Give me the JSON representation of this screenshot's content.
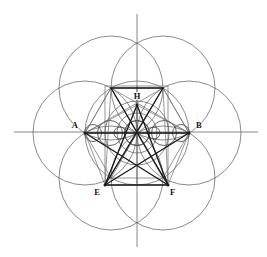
{
  "figure": {
    "canvas": {
      "width": 267,
      "height": 257,
      "background": "#ffffff"
    },
    "center": {
      "x": 137,
      "y": 133
    },
    "radius": 52,
    "colors": {
      "thin_line": "#595959",
      "mid_line": "#4a4a4a",
      "heavy_line": "#1a1a1a",
      "axis": "#6b6b6b",
      "label": "#111111",
      "background": "#ffffff"
    },
    "labels": [
      {
        "id": "A",
        "text": "A",
        "x": 78,
        "y": 128,
        "anchor": "end",
        "point_x": 85,
        "point_y": 133
      },
      {
        "id": "B",
        "text": "B",
        "x": 196,
        "y": 128,
        "anchor": "start",
        "point_x": 189,
        "point_y": 133
      },
      {
        "id": "H",
        "text": "H",
        "x": 137,
        "y": 99,
        "anchor": "middle",
        "point_x": 137,
        "point_y": 105
      },
      {
        "id": "E",
        "text": "E",
        "x": 100,
        "y": 195,
        "anchor": "end",
        "point_x": 105,
        "point_y": 185
      },
      {
        "id": "F",
        "text": "F",
        "x": 170,
        "y": 195,
        "anchor": "start",
        "point_x": 168,
        "point_y": 185
      }
    ],
    "axes": {
      "horizontal": {
        "x1": 14,
        "y1": 132,
        "x2": 258,
        "y2": 132
      },
      "vertical": {
        "x1": 137,
        "y1": 14,
        "x2": 137,
        "y2": 247
      }
    },
    "big_circles": [
      {
        "name": "center-circle",
        "cx": 137,
        "cy": 133,
        "r": 52
      },
      {
        "name": "east-circle",
        "cx": 189,
        "cy": 133,
        "r": 52
      },
      {
        "name": "west-circle",
        "cx": 85,
        "cy": 133,
        "r": 52
      },
      {
        "name": "northeast-circle",
        "cx": 163,
        "cy": 88,
        "r": 52
      },
      {
        "name": "northwest-circle",
        "cx": 111,
        "cy": 88,
        "r": 52
      },
      {
        "name": "southeast-circle",
        "cx": 163,
        "cy": 178,
        "r": 52
      },
      {
        "name": "southwest-circle",
        "cx": 111,
        "cy": 178,
        "r": 52
      }
    ],
    "inner_circles": [
      {
        "name": "inner-circumcircle",
        "cx": 137,
        "cy": 133,
        "r": 32
      },
      {
        "name": "inner-midcircle",
        "cx": 137,
        "cy": 133,
        "r": 20
      },
      {
        "name": "inner-incircle",
        "cx": 137,
        "cy": 133,
        "r": 12.5
      }
    ],
    "axis_small_circles": [
      {
        "name": "axis-circle-1",
        "cx": 93,
        "cy": 133,
        "r": 8.5
      },
      {
        "name": "axis-circle-2",
        "cx": 110,
        "cy": 133,
        "r": 12.5
      },
      {
        "name": "axis-circle-3",
        "cx": 137,
        "cy": 133,
        "r": 12.5
      },
      {
        "name": "axis-circle-4",
        "cx": 164,
        "cy": 133,
        "r": 12.5
      },
      {
        "name": "axis-circle-5",
        "cx": 181,
        "cy": 133,
        "r": 8.5
      },
      {
        "name": "axis-circle-6",
        "cx": 120,
        "cy": 133,
        "r": 6.0
      },
      {
        "name": "axis-circle-7",
        "cx": 154,
        "cy": 133,
        "r": 6.0
      }
    ],
    "hexagon": {
      "name": "inscribed-hexagon",
      "points": "189,133 163,88 111,88 85,133 111,178 163,178"
    },
    "bounding_rectangle": {
      "name": "bounding-rectangle",
      "x": 105,
      "y": 86,
      "width": 63,
      "height": 99
    },
    "star_polygon": {
      "name": "star-pentagram",
      "vertices": [
        {
          "id": "H",
          "x": 137,
          "y": 105
        },
        {
          "id": "NE",
          "x": 163,
          "y": 88
        },
        {
          "id": "B",
          "x": 189,
          "y": 133
        },
        {
          "id": "F",
          "x": 168,
          "y": 185
        },
        {
          "id": "E",
          "x": 105,
          "y": 185
        },
        {
          "id": "A",
          "x": 85,
          "y": 133
        },
        {
          "id": "NW",
          "x": 111,
          "y": 88
        }
      ],
      "heavy_edges": [
        {
          "from": "H",
          "to": "E"
        },
        {
          "from": "H",
          "to": "F"
        },
        {
          "from": "E",
          "to": "F"
        },
        {
          "from": "E",
          "to": "B"
        },
        {
          "from": "F",
          "to": "A"
        },
        {
          "from": "A",
          "to": "B"
        },
        {
          "from": "NW",
          "to": "F"
        },
        {
          "from": "NE",
          "to": "E"
        },
        {
          "from": "NW",
          "to": "NE"
        }
      ],
      "light_edges": [
        {
          "from": "A",
          "to": "H"
        },
        {
          "from": "B",
          "to": "H"
        },
        {
          "from": "A",
          "to": "NE"
        },
        {
          "from": "B",
          "to": "NW"
        },
        {
          "from": "NW",
          "to": "E"
        },
        {
          "from": "NE",
          "to": "F"
        },
        {
          "from": "A",
          "to": "NW"
        },
        {
          "from": "B",
          "to": "NE"
        },
        {
          "from": "A",
          "to": "E"
        },
        {
          "from": "B",
          "to": "F"
        }
      ]
    },
    "center_spokes": [
      {
        "to_x": 85,
        "to_y": 133
      },
      {
        "to_x": 189,
        "to_y": 133
      },
      {
        "to_x": 137,
        "to_y": 105
      },
      {
        "to_x": 105,
        "to_y": 185
      },
      {
        "to_x": 168,
        "to_y": 185
      },
      {
        "to_x": 111,
        "to_y": 88
      },
      {
        "to_x": 163,
        "to_y": 88
      },
      {
        "to_x": 111,
        "to_y": 178
      },
      {
        "to_x": 163,
        "to_y": 178
      },
      {
        "to_x": 137,
        "to_y": 185
      },
      {
        "to_x": 137,
        "to_y": 86
      }
    ]
  }
}
